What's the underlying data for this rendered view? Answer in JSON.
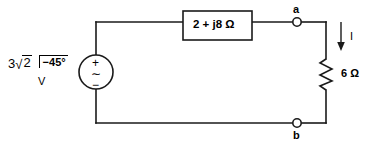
{
  "figure": {
    "background_color": "#ffffff",
    "line_color": "#1a1a1a"
  },
  "source": {
    "magnitude_coefficient": "3",
    "radical_sign": "√",
    "radical_operand": "2",
    "angle": "−45°",
    "unit": "V",
    "polarity_plus": "+",
    "waveform_symbol": "∼",
    "polarity_minus": "−",
    "symbol_name": "ac-voltage-source"
  },
  "impedance": {
    "label": "2 + j8 Ω",
    "real": 2,
    "imaginary": 8,
    "unit": "Ω",
    "symbol_name": "impedance-box"
  },
  "resistor": {
    "label": "6 Ω",
    "value": 6,
    "unit": "Ω",
    "symbol_name": "zigzag-resistor"
  },
  "current": {
    "label": "I",
    "direction": "down"
  },
  "terminals": {
    "a": "a",
    "b": "b"
  }
}
